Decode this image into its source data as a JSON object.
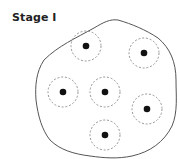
{
  "title": "Stage I",
  "colors": {
    "outline": "#555555",
    "dashed_ring": "#888888",
    "dot": "#111111",
    "text": "#222222"
  },
  "diagram": {
    "type": "cell-blob-with-nuclei",
    "boundary": "irregular closed outline",
    "units": [
      {
        "cx": 86,
        "cy": 46,
        "r": 15
      },
      {
        "cx": 144,
        "cy": 53,
        "r": 15
      },
      {
        "cx": 63,
        "cy": 92,
        "r": 15
      },
      {
        "cx": 105,
        "cy": 92,
        "r": 15
      },
      {
        "cx": 147,
        "cy": 109,
        "r": 15
      },
      {
        "cx": 105,
        "cy": 135,
        "r": 15
      }
    ]
  }
}
